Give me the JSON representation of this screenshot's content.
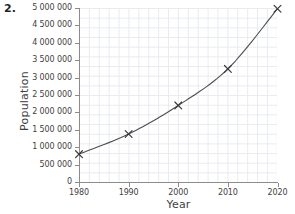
{
  "problem": {
    "number": "2."
  },
  "chart_data": {
    "type": "line",
    "title": "",
    "subtitle": "",
    "xlabel": "Year",
    "ylabel": "Population",
    "x": [
      1980,
      1990,
      2000,
      2010,
      2020
    ],
    "values": [
      800000,
      1380000,
      2200000,
      3250000,
      4980000
    ],
    "series": [
      {
        "name": "Population",
        "x": [
          1980,
          1990,
          2000,
          2010,
          2020
        ],
        "values": [
          800000,
          1380000,
          2200000,
          3250000,
          4980000
        ]
      }
    ],
    "xlim": [
      1980,
      2020
    ],
    "ylim": [
      0,
      5000000
    ],
    "x_tick_labels": [
      "1980",
      "1990",
      "2000",
      "2010",
      "2020"
    ],
    "y_tick_labels": [
      "0",
      "500 000",
      "1 000 000",
      "1 500 000",
      "2 000 000",
      "2 500 000",
      "3 000 000",
      "3 500 000",
      "4 000 000",
      "4 500 000",
      "5 000 000"
    ],
    "y_tick_values": [
      0,
      500000,
      1000000,
      1500000,
      2000000,
      2500000,
      3000000,
      3500000,
      4000000,
      4500000,
      5000000
    ],
    "grid": true,
    "grid_style": "fine graph-paper minor grid",
    "legend": null,
    "legend_position": "none",
    "marker": "x",
    "line_color": "#4d4d4d",
    "marker_color": "#3a3a3a",
    "grid_color": "#e9ebef",
    "axis_color": "#8c8c8c",
    "text_color": "#3f3f3f",
    "annotations": []
  }
}
